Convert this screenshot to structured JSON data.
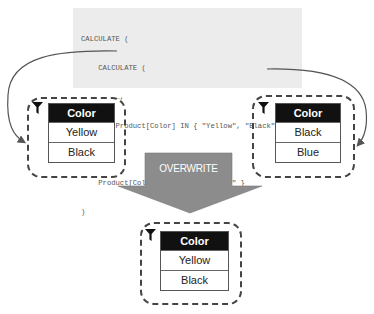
{
  "code": {
    "lines": [
      "CALCULATE (",
      "    CALCULATE (",
      "        …,",
      "        Product[Color] IN { \"Yellow\", \"Black\" }",
      "    ),",
      "    Product[Color] { \"Black\", \"Blue\" }",
      ")"
    ]
  },
  "filters": {
    "inner": {
      "icon": "funnel-icon",
      "header": "Color",
      "rows": [
        "Yellow",
        "Black"
      ]
    },
    "outer": {
      "icon": "funnel-icon",
      "header": "Color",
      "rows": [
        "Black",
        "Blue"
      ]
    },
    "result": {
      "icon": "funnel-icon",
      "header": "Color",
      "rows": [
        "Yellow",
        "Black"
      ]
    }
  },
  "operation": {
    "label": "OVERWRITE",
    "color": "#8c8c8c"
  },
  "colors": {
    "code_bg": "#ececec",
    "header_bg": "#111111",
    "dash": "#444444",
    "connector": "#555555"
  }
}
